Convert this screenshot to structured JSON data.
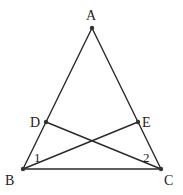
{
  "figure": {
    "type": "isosceles-triangle-with-cevians",
    "stroke_color": "#2a2a2a",
    "background": "#ffffff",
    "points": {
      "A": {
        "x": 92,
        "y": 28,
        "label": "A",
        "label_x": 86,
        "label_y": 20
      },
      "B": {
        "x": 23,
        "y": 169,
        "label": "B",
        "label_x": 5,
        "label_y": 185
      },
      "C": {
        "x": 161,
        "y": 169,
        "label": "C",
        "label_x": 164,
        "label_y": 185
      },
      "D": {
        "x": 46,
        "y": 122,
        "label": "D",
        "label_x": 30,
        "label_y": 127
      },
      "E": {
        "x": 138,
        "y": 122,
        "label": "E",
        "label_x": 142,
        "label_y": 127
      }
    },
    "segments": [
      {
        "from": "A",
        "to": "B"
      },
      {
        "from": "A",
        "to": "C"
      },
      {
        "from": "B",
        "to": "C"
      },
      {
        "from": "D",
        "to": "C"
      },
      {
        "from": "B",
        "to": "E"
      }
    ],
    "angle_labels": [
      {
        "text": "1",
        "x": 34,
        "y": 162,
        "at": "B"
      },
      {
        "text": "2",
        "x": 143,
        "y": 162,
        "at": "C"
      }
    ]
  }
}
